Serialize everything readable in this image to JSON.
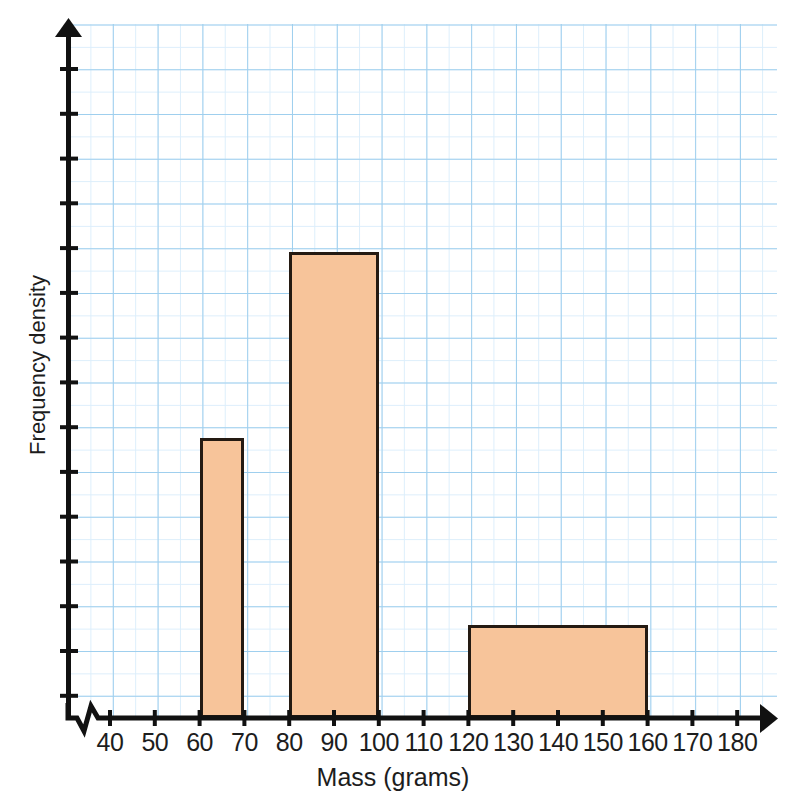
{
  "chart_data": {
    "type": "bar",
    "title": "",
    "subtitle": "",
    "xlabel": "Mass (grams)",
    "ylabel": "Frequency density",
    "xlim": [
      30,
      185
    ],
    "ylim": [
      0,
      15.5
    ],
    "grid": true,
    "legend": null,
    "x_tick_labels": [
      "40",
      "50",
      "60",
      "70",
      "80",
      "90",
      "100",
      "110",
      "120",
      "130",
      "140",
      "150",
      "160",
      "170",
      "180"
    ],
    "x_tick_values": [
      40,
      50,
      60,
      70,
      80,
      90,
      100,
      110,
      120,
      130,
      140,
      150,
      160,
      170,
      180
    ],
    "y_tick_labels": [],
    "y_axis_has_numeric_labels": false,
    "axis_break_on_x_axis": true,
    "bars": [
      {
        "label": "60-70",
        "x_start": 60,
        "x_end": 70,
        "height_grid_units": 6.25
      },
      {
        "label": "80-100",
        "x_start": 80,
        "x_end": 100,
        "height_grid_units": 10.4
      },
      {
        "label": "120-160",
        "x_start": 120,
        "x_end": 160,
        "height_grid_units": 2.08
      }
    ],
    "bar_fill_color": "#f7c49a",
    "bar_edge_color": "#241a12",
    "grid_color": "#9fcfee",
    "axis_color": "#111111",
    "background_color": "#ffffff"
  }
}
